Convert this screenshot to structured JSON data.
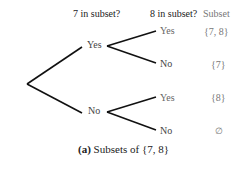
{
  "headers": {
    "first": "7 in subset?",
    "second": "8 in subset?",
    "result": "Subset"
  },
  "level1": {
    "yes": "Yes",
    "no": "No"
  },
  "level2": [
    {
      "label": "Yes",
      "subset": "{7, 8}"
    },
    {
      "label": "No",
      "subset": "{7}"
    },
    {
      "label": "Yes",
      "subset": "{8}"
    },
    {
      "label": "No",
      "subset": "∅"
    }
  ],
  "caption": {
    "tag": "(a)",
    "text": "Subsets of {7, 8}"
  }
}
